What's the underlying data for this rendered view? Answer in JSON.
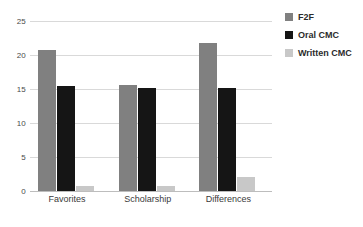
{
  "chart_data": {
    "type": "bar",
    "title": "",
    "xlabel": "",
    "ylabel": "",
    "categories": [
      "Favorites",
      "Scholarship",
      "Differences"
    ],
    "series": [
      {
        "name": "F2F",
        "color": "#808080",
        "values": [
          20.8,
          15.6,
          21.7
        ]
      },
      {
        "name": "Oral CMC",
        "color": "#151515",
        "values": [
          15.4,
          15.1,
          15.1
        ]
      },
      {
        "name": "Written CMC",
        "color": "#c8c8c8",
        "values": [
          0.8,
          0.8,
          2.1
        ]
      }
    ],
    "ylim": [
      0,
      25
    ],
    "yticks": [
      0,
      5,
      10,
      15,
      20,
      25
    ],
    "ytick_labels": [
      "0",
      "5",
      "10",
      "15",
      "20",
      "25"
    ],
    "grid": true,
    "legend_position": "right"
  },
  "legend": {
    "items": [
      {
        "label": "F2F",
        "color": "#808080"
      },
      {
        "label": "Oral CMC",
        "color": "#151515"
      },
      {
        "label": "Written CMC",
        "color": "#c8c8c8"
      }
    ]
  }
}
